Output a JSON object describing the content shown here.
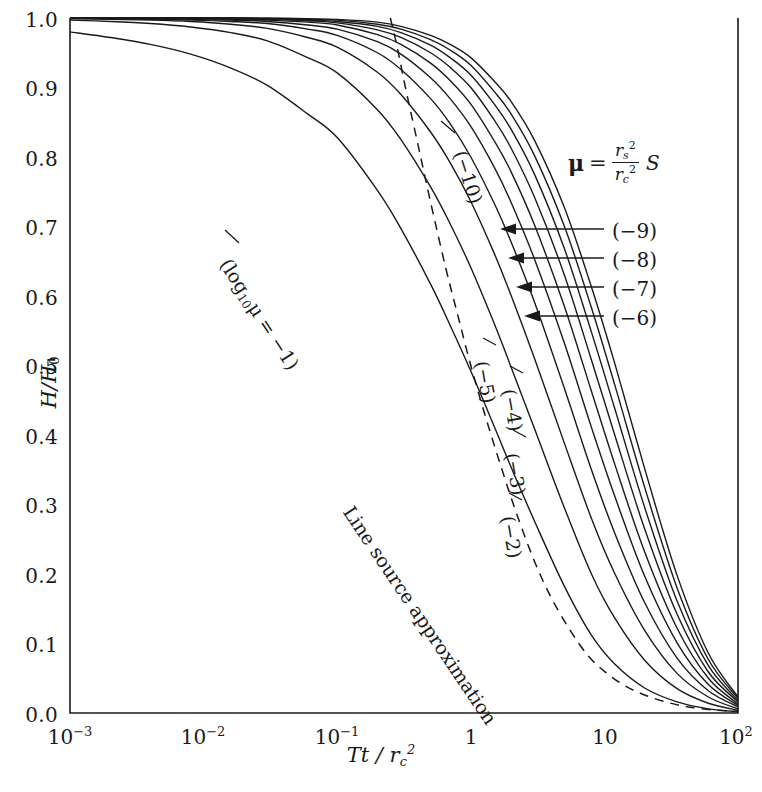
{
  "chart_data": {
    "type": "line",
    "title": "",
    "xlabel": "Tt / r_c^2",
    "ylabel": "H/H_0",
    "xscale": "log",
    "xlim": [
      0.001,
      100
    ],
    "ylim": [
      0.0,
      1.0
    ],
    "grid": false,
    "legend": "inline curve labels",
    "xticklabels": [
      "10-3",
      "10-2",
      "10-1",
      "1",
      "10",
      "102"
    ],
    "xtickvalues": [
      0.001,
      0.01,
      0.1,
      1,
      10,
      100
    ],
    "yticklabels": [
      "0.0",
      "0.1",
      "0.2",
      "0.3",
      "0.4",
      "0.5",
      "0.6",
      "0.7",
      "0.8",
      "0.9",
      "1.0"
    ],
    "ytickvalues": [
      0.0,
      0.1,
      0.2,
      0.3,
      0.4,
      0.5,
      0.6,
      0.7,
      0.8,
      0.9,
      1.0
    ],
    "annotation_formula": "mu = (r_s^2 / r_c^2) S",
    "series": [
      {
        "name": "(-1)",
        "label": "(log10μ = -1)",
        "log10mu": -1,
        "x": [
          0.001,
          0.002,
          0.004,
          0.008,
          0.016,
          0.03,
          0.06,
          0.1,
          0.2,
          0.3,
          0.5,
          0.7,
          1.0,
          1.5,
          2.0,
          3.0,
          5.0,
          8.0,
          12.0,
          20.0,
          35.0,
          60.0,
          100.0
        ],
        "y": [
          0.98,
          0.972,
          0.962,
          0.948,
          0.928,
          0.903,
          0.862,
          0.828,
          0.752,
          0.697,
          0.617,
          0.558,
          0.492,
          0.412,
          0.354,
          0.276,
          0.183,
          0.112,
          0.07,
          0.036,
          0.016,
          0.006,
          0.002
        ]
      },
      {
        "name": "(-2)",
        "label": "(-2)",
        "log10mu": -2,
        "x": [
          0.001,
          0.002,
          0.004,
          0.008,
          0.016,
          0.03,
          0.06,
          0.1,
          0.2,
          0.3,
          0.5,
          0.7,
          1.0,
          1.5,
          2.0,
          3.0,
          5.0,
          8.0,
          12.0,
          20.0,
          35.0,
          60.0,
          100.0
        ],
        "y": [
          0.997,
          0.995,
          0.992,
          0.987,
          0.979,
          0.967,
          0.943,
          0.921,
          0.868,
          0.825,
          0.757,
          0.704,
          0.641,
          0.56,
          0.498,
          0.409,
          0.296,
          0.2,
          0.136,
          0.076,
          0.035,
          0.014,
          0.004
        ]
      },
      {
        "name": "(-3)",
        "label": "(-3)",
        "log10mu": -3,
        "x": [
          0.001,
          0.002,
          0.004,
          0.008,
          0.016,
          0.03,
          0.06,
          0.1,
          0.2,
          0.3,
          0.5,
          0.7,
          1.0,
          1.5,
          2.0,
          3.0,
          5.0,
          8.0,
          12.0,
          20.0,
          35.0,
          60.0,
          100.0
        ],
        "y": [
          0.999,
          0.998,
          0.997,
          0.995,
          0.991,
          0.985,
          0.972,
          0.958,
          0.922,
          0.89,
          0.836,
          0.792,
          0.736,
          0.661,
          0.601,
          0.51,
          0.389,
          0.28,
          0.2,
          0.119,
          0.057,
          0.023,
          0.006
        ]
      },
      {
        "name": "(-4)",
        "label": "(-4)",
        "log10mu": -4,
        "x": [
          0.001,
          0.002,
          0.004,
          0.008,
          0.016,
          0.03,
          0.06,
          0.1,
          0.2,
          0.3,
          0.5,
          0.7,
          1.0,
          1.5,
          2.0,
          3.0,
          5.0,
          8.0,
          12.0,
          20.0,
          35.0,
          60.0,
          100.0
        ],
        "y": [
          1.0,
          0.999,
          0.998,
          0.997,
          0.995,
          0.992,
          0.984,
          0.975,
          0.95,
          0.926,
          0.884,
          0.848,
          0.8,
          0.733,
          0.678,
          0.591,
          0.468,
          0.35,
          0.258,
          0.159,
          0.079,
          0.032,
          0.009
        ]
      },
      {
        "name": "(-5)",
        "label": "(-5)",
        "log10mu": -5,
        "x": [
          0.001,
          0.002,
          0.004,
          0.008,
          0.016,
          0.03,
          0.06,
          0.1,
          0.2,
          0.3,
          0.5,
          0.7,
          1.0,
          1.5,
          2.0,
          3.0,
          5.0,
          8.0,
          12.0,
          20.0,
          35.0,
          60.0,
          100.0
        ],
        "y": [
          1.0,
          1.0,
          0.999,
          0.998,
          0.997,
          0.995,
          0.99,
          0.984,
          0.966,
          0.948,
          0.914,
          0.884,
          0.844,
          0.785,
          0.735,
          0.653,
          0.533,
          0.411,
          0.311,
          0.197,
          0.101,
          0.041,
          0.011
        ]
      },
      {
        "name": "(-6)",
        "label": "(-6)",
        "log10mu": -6,
        "x": [
          0.001,
          0.002,
          0.004,
          0.008,
          0.016,
          0.03,
          0.06,
          0.1,
          0.2,
          0.3,
          0.5,
          0.7,
          1.0,
          1.5,
          2.0,
          3.0,
          5.0,
          8.0,
          12.0,
          20.0,
          35.0,
          60.0,
          100.0
        ],
        "y": [
          1.0,
          1.0,
          1.0,
          0.999,
          0.998,
          0.997,
          0.994,
          0.99,
          0.976,
          0.962,
          0.935,
          0.91,
          0.876,
          0.823,
          0.779,
          0.702,
          0.586,
          0.463,
          0.357,
          0.232,
          0.122,
          0.05,
          0.013
        ]
      },
      {
        "name": "(-7)",
        "label": "(-7)",
        "log10mu": -7,
        "x": [
          0.001,
          0.002,
          0.004,
          0.008,
          0.016,
          0.03,
          0.06,
          0.1,
          0.2,
          0.3,
          0.5,
          0.7,
          1.0,
          1.5,
          2.0,
          3.0,
          5.0,
          8.0,
          12.0,
          20.0,
          35.0,
          60.0,
          100.0
        ],
        "y": [
          1.0,
          1.0,
          1.0,
          1.0,
          0.999,
          0.998,
          0.996,
          0.993,
          0.983,
          0.972,
          0.95,
          0.929,
          0.9,
          0.853,
          0.813,
          0.742,
          0.631,
          0.508,
          0.399,
          0.265,
          0.142,
          0.059,
          0.016
        ]
      },
      {
        "name": "(-8)",
        "label": "(-8)",
        "log10mu": -8,
        "x": [
          0.001,
          0.002,
          0.004,
          0.008,
          0.016,
          0.03,
          0.06,
          0.1,
          0.2,
          0.3,
          0.5,
          0.7,
          1.0,
          1.5,
          2.0,
          3.0,
          5.0,
          8.0,
          12.0,
          20.0,
          35.0,
          60.0,
          100.0
        ],
        "y": [
          1.0,
          1.0,
          1.0,
          1.0,
          1.0,
          0.999,
          0.997,
          0.995,
          0.988,
          0.979,
          0.961,
          0.943,
          0.918,
          0.876,
          0.84,
          0.775,
          0.669,
          0.548,
          0.437,
          0.296,
          0.161,
          0.068,
          0.018
        ]
      },
      {
        "name": "(-9)",
        "label": "(-9)",
        "log10mu": -9,
        "x": [
          0.001,
          0.002,
          0.004,
          0.008,
          0.016,
          0.03,
          0.06,
          0.1,
          0.2,
          0.3,
          0.5,
          0.7,
          1.0,
          1.5,
          2.0,
          3.0,
          5.0,
          8.0,
          12.0,
          20.0,
          35.0,
          60.0,
          100.0
        ],
        "y": [
          1.0,
          1.0,
          1.0,
          1.0,
          1.0,
          0.999,
          0.998,
          0.997,
          0.991,
          0.984,
          0.969,
          0.954,
          0.932,
          0.894,
          0.862,
          0.802,
          0.701,
          0.583,
          0.471,
          0.325,
          0.18,
          0.077,
          0.021
        ]
      },
      {
        "name": "(-10)",
        "label": "(-10)",
        "log10mu": -10,
        "x": [
          0.001,
          0.002,
          0.004,
          0.008,
          0.016,
          0.03,
          0.06,
          0.1,
          0.2,
          0.3,
          0.5,
          0.7,
          1.0,
          1.5,
          2.0,
          3.0,
          5.0,
          8.0,
          12.0,
          20.0,
          35.0,
          60.0,
          100.0
        ],
        "y": [
          1.0,
          1.0,
          1.0,
          1.0,
          1.0,
          1.0,
          0.999,
          0.998,
          0.994,
          0.988,
          0.975,
          0.962,
          0.943,
          0.909,
          0.88,
          0.824,
          0.728,
          0.613,
          0.502,
          0.352,
          0.198,
          0.086,
          0.023
        ]
      },
      {
        "name": "line-source-approximation",
        "label": "Line source approximation",
        "style": "dashed",
        "x": [
          0.25,
          0.28,
          0.32,
          0.4,
          0.5,
          0.65,
          0.8,
          1.0,
          1.3,
          1.7,
          2.2,
          3.0,
          4.0,
          5.5,
          7.5,
          10.0,
          14.0,
          20.0,
          30.0,
          45.0,
          70.0,
          100.0
        ],
        "y": [
          1.0,
          0.96,
          0.905,
          0.82,
          0.735,
          0.64,
          0.572,
          0.5,
          0.424,
          0.352,
          0.287,
          0.218,
          0.166,
          0.12,
          0.083,
          0.06,
          0.04,
          0.026,
          0.015,
          0.008,
          0.004,
          0.002
        ]
      }
    ]
  },
  "axes": {
    "y_label_main": "H/H",
    "y_label_sub": "0",
    "x_label_main": "Tt / r",
    "x_label_sub": "c",
    "x_label_sup": "2"
  },
  "formula": {
    "mu_symbol": "μ",
    "equals": "=",
    "numerator_var": "r",
    "numerator_sub": "s",
    "numerator_sup": "2",
    "denominator_var": "r",
    "denominator_sub": "c",
    "denominator_sup": "2",
    "factor": "S"
  },
  "curve_labels": {
    "arrows": [
      {
        "text": "(−9)",
        "for": "-9"
      },
      {
        "text": "(−8)",
        "for": "-8"
      },
      {
        "text": "(−7)",
        "for": "-7"
      },
      {
        "text": "(−6)",
        "for": "-6"
      }
    ],
    "inline": [
      {
        "text": "(−10)",
        "for": "-10"
      },
      {
        "text": "(−5)",
        "for": "-5"
      },
      {
        "text": "(−4)",
        "for": "-4"
      },
      {
        "text": "(−3)",
        "for": "-3"
      },
      {
        "text": "(−2)",
        "for": "-2"
      }
    ],
    "first_curve": {
      "prefix": "(log",
      "sub": "10",
      "mu": "μ",
      "suffix": " = −1)"
    },
    "dashed": "Line source approximation"
  },
  "ticks": {
    "y": [
      "1.0",
      "0.9",
      "0.8",
      "0.7",
      "0.6",
      "0.5",
      "0.4",
      "0.3",
      "0.2",
      "0.1",
      "0.0"
    ],
    "x": [
      {
        "mantissa": "10",
        "exp": "−3"
      },
      {
        "mantissa": "10",
        "exp": "−2"
      },
      {
        "mantissa": "10",
        "exp": "−1"
      },
      {
        "mantissa": "1",
        "exp": ""
      },
      {
        "mantissa": "10",
        "exp": ""
      },
      {
        "mantissa": "10",
        "exp": "2"
      }
    ]
  },
  "colors": {
    "line": "#1a1a1a",
    "axis": "#1a1a1a",
    "background": "#ffffff"
  }
}
